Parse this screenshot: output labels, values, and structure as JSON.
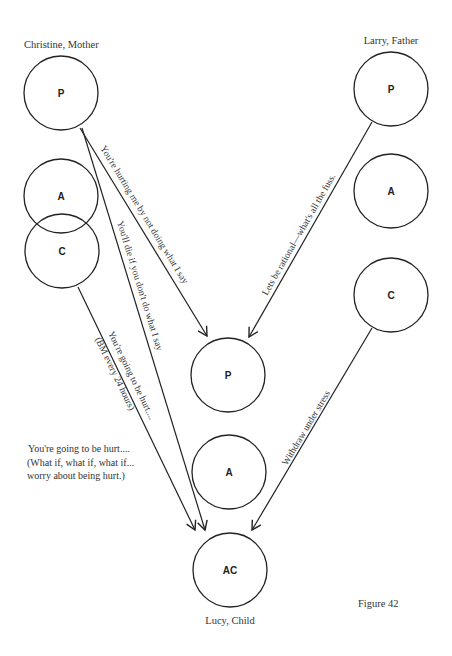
{
  "figure": {
    "caption": "Figure 42"
  },
  "people": {
    "mother": {
      "label": "Christine, Mother",
      "states": {
        "parent": "P",
        "adult": "A",
        "child": "C"
      }
    },
    "father": {
      "label": "Larry, Father",
      "states": {
        "parent": "P",
        "adult": "A",
        "child": "C"
      }
    },
    "child": {
      "label": "Lucy, Child",
      "states": {
        "parent": "P",
        "adult": "A",
        "adapted_child": "AC"
      }
    }
  },
  "messages": {
    "mother_p_to_child_p": "You're hurting me by not doing what I say",
    "mother_p_to_child_ac": "You'll die if you don't do what I say",
    "mother_c_to_child_ac_line1": "You're going to be hurt....",
    "mother_c_to_child_ac_line2": "(BM every 24 hours)",
    "father_p_to_child_p": "Lets be rational—what's all the fuss.",
    "father_c_to_child_ac": "Withdraw under stress"
  },
  "side_note": {
    "line1": "You're going to be hurt....",
    "line2": "(What if, what if, what if...",
    "line3": "worry about being hurt.)"
  }
}
